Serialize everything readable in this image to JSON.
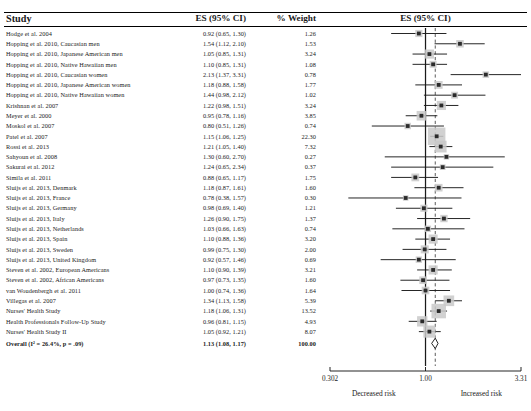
{
  "header": {
    "study": "Study",
    "es": "ES (95% CI)",
    "weight": "% Weight",
    "plot_title": "ES (95% CI)"
  },
  "axis": {
    "ticks": [
      "0.302",
      "1.00",
      "3.31"
    ],
    "tick_values": [
      0.302,
      1.0,
      3.31
    ],
    "left_caption": "Decreased risk",
    "right_caption": "Increased risk",
    "null_line": 1.0,
    "pooled_line": 1.13
  },
  "colors": {
    "marker": "#2b2b2b",
    "box": "#c9c9c9",
    "line": "#1a1a1a",
    "rule": "#000000"
  },
  "chart_data": {
    "type": "forest",
    "title": "ES (95% CI)",
    "xlabel": "",
    "ylabel": "",
    "xscale": "log",
    "xlim": [
      0.302,
      3.31
    ],
    "xticks": [
      0.302,
      1.0,
      3.31
    ],
    "xticklabels": [
      "0.302",
      "1.00",
      "3.31"
    ],
    "reference_line": 1.0,
    "pooled_line": 1.13,
    "grid": false,
    "legend": null,
    "annotations": [
      "Decreased risk",
      "Increased risk"
    ],
    "columns": [
      "Study",
      "ES (95% CI)",
      "% Weight"
    ],
    "rows": [
      {
        "study": "Hodge et al. 2004",
        "es_text": "0.92 (0.65, 1.30)",
        "es": 0.92,
        "lo": 0.65,
        "hi": 1.3,
        "weight_text": "1.26",
        "weight": 1.26
      },
      {
        "study": "Hopping et al. 2010, Caucasian men",
        "es_text": "1.54 (1.12, 2.10)",
        "es": 1.54,
        "lo": 1.12,
        "hi": 2.1,
        "weight_text": "1.53",
        "weight": 1.53
      },
      {
        "study": "Hopping et al. 2010, Japanese American men",
        "es_text": "1.05 (0.85, 1.31)",
        "es": 1.05,
        "lo": 0.85,
        "hi": 1.31,
        "weight_text": "3.24",
        "weight": 3.24
      },
      {
        "study": "Hopping et al. 2010, Native Hawaiian men",
        "es_text": "1.10 (0.85, 1.31)",
        "es": 1.1,
        "lo": 0.85,
        "hi": 1.31,
        "weight_text": "1.08",
        "weight": 1.08
      },
      {
        "study": "Hopping et al. 2010, Caucasian women",
        "es_text": "2.13 (1.37, 3.31)",
        "es": 2.13,
        "lo": 1.37,
        "hi": 3.31,
        "weight_text": "0.78",
        "weight": 0.78
      },
      {
        "study": "Hopping et al. 2010, Japanese American women",
        "es_text": "1.18 (0.88, 1.58)",
        "es": 1.18,
        "lo": 0.88,
        "hi": 1.58,
        "weight_text": "1.77",
        "weight": 1.77
      },
      {
        "study": "Hopping et al. 2010, Native Hawaiian women",
        "es_text": "1.44 (0.98, 2.12)",
        "es": 1.44,
        "lo": 0.98,
        "hi": 2.12,
        "weight_text": "1.02",
        "weight": 1.02
      },
      {
        "study": "Krishnan et al. 2007",
        "es_text": "1.22 (0.98, 1.51)",
        "es": 1.22,
        "lo": 0.98,
        "hi": 1.51,
        "weight_text": "3.24",
        "weight": 3.24
      },
      {
        "study": "Meyer et al. 2000",
        "es_text": "0.95 (0.78, 1.16)",
        "es": 0.95,
        "lo": 0.78,
        "hi": 1.16,
        "weight_text": "3.85",
        "weight": 3.85
      },
      {
        "study": "Moskol et al. 2007",
        "es_text": "0.80 (0.51, 1.26)",
        "es": 0.8,
        "lo": 0.51,
        "hi": 1.26,
        "weight_text": "0.74",
        "weight": 0.74
      },
      {
        "study": "Patel et al. 2007",
        "es_text": "1.15 (1.06, 1.25)",
        "es": 1.15,
        "lo": 1.06,
        "hi": 1.25,
        "weight_text": "22.30",
        "weight": 22.3
      },
      {
        "study": "Rossi et al. 2013",
        "es_text": "1.21 (1.05, 1.40)",
        "es": 1.21,
        "lo": 1.05,
        "hi": 1.4,
        "weight_text": "7.32",
        "weight": 7.32
      },
      {
        "study": "Sahyoun et al. 2008",
        "es_text": "1.30 (0.60, 2.70)",
        "es": 1.3,
        "lo": 0.6,
        "hi": 2.7,
        "weight_text": "0.27",
        "weight": 0.27
      },
      {
        "study": "Sakurai et al. 2012",
        "es_text": "1.24 (0.65, 2.34)",
        "es": 1.24,
        "lo": 0.65,
        "hi": 2.34,
        "weight_text": "0.37",
        "weight": 0.37
      },
      {
        "study": "Simila et al. 2011",
        "es_text": "0.88 (0.65, 1.17)",
        "es": 0.88,
        "lo": 0.65,
        "hi": 1.17,
        "weight_text": "1.75",
        "weight": 1.75
      },
      {
        "study": "Sluijs et al. 2013, Denmark",
        "es_text": "1.18 (0.87, 1.61)",
        "es": 1.18,
        "lo": 0.87,
        "hi": 1.61,
        "weight_text": "1.60",
        "weight": 1.6
      },
      {
        "study": "Sluijs et al. 2013, France",
        "es_text": "0.78 (0.38, 1.57)",
        "es": 0.78,
        "lo": 0.38,
        "hi": 1.57,
        "weight_text": "0.30",
        "weight": 0.3
      },
      {
        "study": "Sluijs et al. 2013, Germany",
        "es_text": "0.98 (0.69, 1.40)",
        "es": 0.98,
        "lo": 0.69,
        "hi": 1.4,
        "weight_text": "1.21",
        "weight": 1.21
      },
      {
        "study": "Sluijs et al. 2013, Italy",
        "es_text": "1.26 (0.90, 1.75)",
        "es": 1.26,
        "lo": 0.9,
        "hi": 1.75,
        "weight_text": "1.37",
        "weight": 1.37
      },
      {
        "study": "Sluijs et al. 2013, Netherlands",
        "es_text": "1.03 (0.66, 1.63)",
        "es": 1.03,
        "lo": 0.66,
        "hi": 1.63,
        "weight_text": "0.74",
        "weight": 0.74
      },
      {
        "study": "Sluijs et al. 2013, Spain",
        "es_text": "1.10 (0.88, 1.36)",
        "es": 1.1,
        "lo": 0.88,
        "hi": 1.36,
        "weight_text": "3.20",
        "weight": 3.2
      },
      {
        "study": "Sluijs et al. 2013, Sweden",
        "es_text": "0.99 (0.75, 1.30)",
        "es": 0.99,
        "lo": 0.75,
        "hi": 1.3,
        "weight_text": "2.00",
        "weight": 2.0
      },
      {
        "study": "Sluijs et al. 2013, United Kingdom",
        "es_text": "0.92 (0.57, 1.46)",
        "es": 0.92,
        "lo": 0.57,
        "hi": 1.46,
        "weight_text": "0.69",
        "weight": 0.69
      },
      {
        "study": "Steven et al. 2002, European Americans",
        "es_text": "1.10 (0.90, 1.39)",
        "es": 1.1,
        "lo": 0.9,
        "hi": 1.39,
        "weight_text": "3.21",
        "weight": 3.21
      },
      {
        "study": "Steven et al. 2002, African Americans",
        "es_text": "0.97 (0.73, 1.35)",
        "es": 0.97,
        "lo": 0.73,
        "hi": 1.35,
        "weight_text": "1.60",
        "weight": 1.6
      },
      {
        "study": "van Woudenbergh et al. 2011",
        "es_text": "1.00 (0.74, 1.36)",
        "es": 1.0,
        "lo": 0.74,
        "hi": 1.36,
        "weight_text": "1.64",
        "weight": 1.64
      },
      {
        "study": "Villegas et al. 2007",
        "es_text": "1.34 (1.13, 1.58)",
        "es": 1.34,
        "lo": 1.13,
        "hi": 1.58,
        "weight_text": "5.39",
        "weight": 5.39
      },
      {
        "study": "Nurses' Health Study",
        "es_text": "1.18 (1.06, 1.31)",
        "es": 1.18,
        "lo": 1.06,
        "hi": 1.31,
        "weight_text": "13.52",
        "weight": 13.52
      },
      {
        "study": "Health Professionals Follow-Up Study",
        "es_text": "0.96 (0.81, 1.15)",
        "es": 0.96,
        "lo": 0.81,
        "hi": 1.15,
        "weight_text": "4.93",
        "weight": 4.93
      },
      {
        "study": "Nurses' Health Study II",
        "es_text": "1.05 (0.92, 1.21)",
        "es": 1.05,
        "lo": 0.92,
        "hi": 1.21,
        "weight_text": "8.07",
        "weight": 8.07
      }
    ],
    "overall": {
      "study": "Overall (I² = 26.4%, p = .09)",
      "es_text": "1.13 (1.08, 1.17)",
      "es": 1.13,
      "lo": 1.08,
      "hi": 1.17,
      "weight_text": "100.00",
      "weight": 100.0,
      "heterogeneity_i2": "26.4%",
      "p_value": ".09"
    }
  }
}
